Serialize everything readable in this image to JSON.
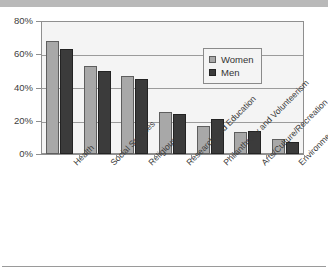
{
  "chart_data": {
    "type": "bar",
    "title": "",
    "xlabel": "",
    "ylabel": "",
    "ylim": [
      0,
      80
    ],
    "yticks": [
      0,
      20,
      40,
      60,
      80
    ],
    "ytick_labels": [
      "0%",
      "20%",
      "40%",
      "60%",
      "80%"
    ],
    "grid": true,
    "legend_position": "inside-upper-right",
    "categories": [
      "Health",
      "Social Services",
      "Religious",
      "Research and Education",
      "Philanthropy and Volunteerism",
      "Arts/Culture/Recreation",
      "Environment"
    ],
    "series": [
      {
        "name": "Women",
        "color": "#a8a8a8",
        "values": [
          68,
          53,
          47,
          25,
          17,
          13,
          9
        ]
      },
      {
        "name": "Men",
        "color": "#3b3b3b",
        "values": [
          63,
          50,
          45,
          24,
          21,
          14,
          7
        ]
      }
    ]
  },
  "legend": {
    "items": [
      {
        "label": "Women",
        "swatch": "women"
      },
      {
        "label": "Men",
        "swatch": "men"
      }
    ]
  },
  "axes": {
    "y_tick_labels": [
      "80%",
      "60%",
      "40%",
      "20%",
      "0%"
    ]
  }
}
